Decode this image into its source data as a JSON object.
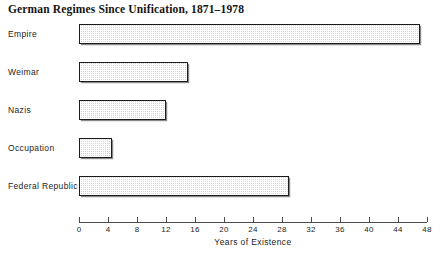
{
  "chart_data": {
    "type": "bar",
    "orientation": "horizontal",
    "title": "German Regimes Since Unification, 1871–1978",
    "xlabel": "Years of Existence",
    "ylabel": "",
    "categories": [
      "Empire",
      "Weimar",
      "Nazis",
      "Occupation",
      "Federal Republic"
    ],
    "values": [
      47,
      15,
      12,
      4.5,
      29
    ],
    "xlim": [
      0,
      48
    ],
    "xticks": [
      0,
      4,
      8,
      12,
      16,
      20,
      24,
      28,
      32,
      36,
      40,
      44,
      48
    ],
    "xtick_labels": [
      "0",
      "4",
      "8",
      "12",
      "16",
      "20",
      "24",
      "28",
      "32",
      "36",
      "40",
      "44",
      "48"
    ],
    "grid": false,
    "legend": null,
    "bar_fill": "#d6d6d6",
    "bar_edge": "#1c1c1c",
    "series": [
      {
        "name": "Years of Existence",
        "values": [
          47,
          15,
          12,
          4.5,
          29
        ]
      }
    ]
  },
  "figure": {
    "title": "German Regimes Since Unification, 1871–1978",
    "axis_title": "Years of Existence"
  }
}
